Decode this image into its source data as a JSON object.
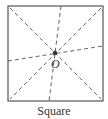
{
  "figure": {
    "shape_name": "Square",
    "center_label": "O",
    "colors": {
      "border": "#555555",
      "dashed_lines": "#666666",
      "center_point": "#333333",
      "text": "#333333"
    },
    "square": {
      "x": 8,
      "y": 6,
      "width": 95,
      "height": 95
    },
    "center": {
      "x": 55,
      "y": 53
    },
    "symmetry_lines": [
      {
        "name": "diagonal-tl-br",
        "x1": 10,
        "y1": 8,
        "x2": 101,
        "y2": 99
      },
      {
        "name": "diagonal-tr-bl",
        "x1": 101,
        "y1": 8,
        "x2": 10,
        "y2": 99
      },
      {
        "name": "near-vertical",
        "x1": 61,
        "y1": 6,
        "x2": 49,
        "y2": 101
      },
      {
        "name": "near-horizontal",
        "x1": 8,
        "y1": 61,
        "x2": 103,
        "y2": 46
      }
    ]
  }
}
